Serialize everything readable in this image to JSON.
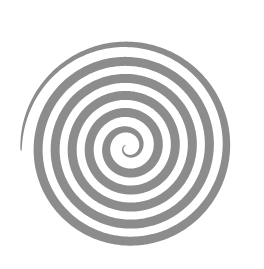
{
  "image": {
    "kind": "spiral-figure",
    "title": "Spiral",
    "width": 264,
    "height": 269,
    "background_color": "#ffffff"
  },
  "spiral": {
    "name": "archimedean-spiral",
    "stroke_color": "#8c8c8c",
    "fill_color": "#8c8c8c",
    "center_x": 128,
    "center_y": 147,
    "outer_radius": 107,
    "inner_radius": 3,
    "turns": 6.1,
    "ring_spacing": 17.5,
    "start_angle_deg": 178,
    "direction": "clockwise",
    "stroke_width_outer": 1.0,
    "stroke_width_mid": 9.0,
    "stroke_width_inner": 0.8,
    "taper": "thin-at-tail-thick-in-body-thin-at-center",
    "bounds": {
      "left": 21,
      "top": 20,
      "right": 235,
      "bottom": 252
    }
  }
}
